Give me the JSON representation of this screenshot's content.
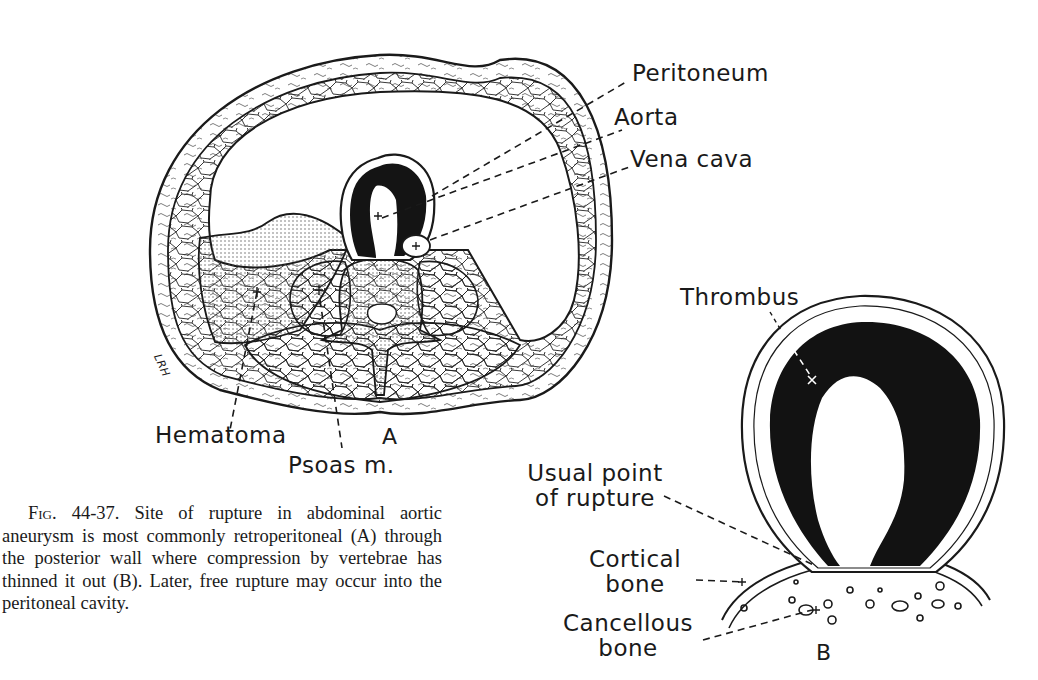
{
  "figure": {
    "number": "Fig. 44-37.",
    "caption": "Site of rupture in abdominal aortic aneurysm is most commonly retroperitoneal (A) through the posterior wall where compression by vertebrae has thinned it out (B). Later, free rupture may occur into the peritoneal cavity.",
    "panels": {
      "a": {
        "label": "A",
        "annotations": {
          "peritoneum": "Peritoneum",
          "aorta": "Aorta",
          "vena_cava": "Vena cava",
          "hematoma": "Hematoma",
          "psoas": "Psoas m."
        },
        "artist_signature": "LRH"
      },
      "b": {
        "label": "B",
        "annotations": {
          "thrombus": "Thrombus",
          "rupture_line1": "Usual point",
          "rupture_line2": "of rupture",
          "cortical_line1": "Cortical",
          "cortical_line2": "bone",
          "cancellous_line1": "Cancellous",
          "cancellous_line2": "bone"
        }
      }
    },
    "colors": {
      "ink": "#1a1a1a",
      "paper": "#ffffff",
      "stipple": "#888888"
    }
  }
}
